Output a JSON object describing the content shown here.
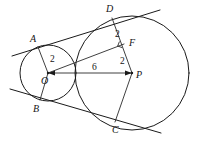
{
  "figure": {
    "background_color": "#ffffff",
    "stroke_color": "#1a1a1a",
    "width": 200,
    "height": 142
  },
  "points": [
    {
      "id": "A",
      "label": "A",
      "x": 38,
      "y": 47,
      "label_x": 30,
      "label_y": 34,
      "role": "tangent-point-small-circle-upper"
    },
    {
      "id": "B",
      "label": "B",
      "x": 40,
      "y": 100,
      "label_x": 33,
      "label_y": 104,
      "role": "tangent-point-small-circle-lower"
    },
    {
      "id": "C",
      "label": "C",
      "x": 115,
      "y": 122,
      "label_x": 112,
      "label_y": 125,
      "role": "tangent-point-large-circle-lower"
    },
    {
      "id": "D",
      "label": "D",
      "x": 112,
      "y": 18,
      "label_x": 106,
      "label_y": 4,
      "role": "tangent-point-large-circle-upper"
    },
    {
      "id": "F",
      "label": "F",
      "x": 124,
      "y": 44,
      "label_x": 129,
      "label_y": 38,
      "role": "foot-of-perpendicular"
    },
    {
      "id": "O",
      "label": "O",
      "x": 48,
      "y": 73,
      "label_x": 41,
      "label_y": 76,
      "role": "center-small-circle"
    },
    {
      "id": "P",
      "label": "P",
      "x": 132,
      "y": 73,
      "label_x": 136,
      "label_y": 70,
      "role": "center-large-circle"
    }
  ],
  "circles": [
    {
      "id": "small",
      "center": "O",
      "cx": 48,
      "cy": 73,
      "r": 28,
      "label": "circle O"
    },
    {
      "id": "large",
      "center": "P",
      "cx": 132,
      "cy": 73,
      "r": 57,
      "label": "circle P"
    }
  ],
  "measurements": [
    {
      "id": "OA",
      "value": "2",
      "x": 50,
      "y": 55,
      "segment": "O to A",
      "description": "radius of small circle"
    },
    {
      "id": "DF",
      "value": "2",
      "x": 115,
      "y": 30,
      "segment": "D to F",
      "description": "upper part of radius PD"
    },
    {
      "id": "FP",
      "value": "2",
      "x": 120,
      "y": 57,
      "segment": "F to P",
      "description": "lower part of radius PD"
    },
    {
      "id": "OP",
      "value": "6",
      "x": 92,
      "y": 63,
      "segment": "O to P",
      "description": "distance between centers"
    }
  ],
  "segments": [
    {
      "id": "OA",
      "from": "O",
      "to": "A",
      "kind": "radius"
    },
    {
      "id": "OB",
      "from": "O",
      "to": "B",
      "kind": "radius"
    },
    {
      "id": "OP",
      "from": "O",
      "to": "P",
      "kind": "center-line",
      "arrow": "both"
    },
    {
      "id": "OF",
      "from": "O",
      "to": "F",
      "kind": "perpendicular-leg"
    },
    {
      "id": "PD",
      "from": "P",
      "to": "D",
      "kind": "radius"
    },
    {
      "id": "PC",
      "from": "P",
      "to": "C",
      "kind": "radius"
    },
    {
      "id": "AD",
      "from": "A",
      "to": "D",
      "kind": "common-external-tangent-upper"
    },
    {
      "id": "BC",
      "from": "B",
      "to": "C",
      "kind": "common-external-tangent-lower"
    }
  ],
  "right_angle_marks": [
    {
      "id": "at-F",
      "vertex": "F",
      "description": "OF perpendicular to PD"
    }
  ]
}
